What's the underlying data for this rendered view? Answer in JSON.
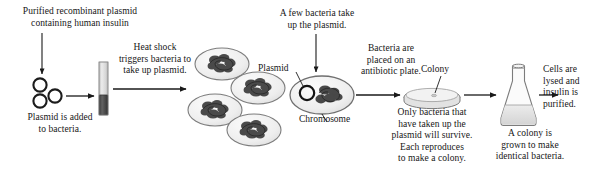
{
  "figure": {
    "background_color": "#ffffff",
    "ink_color": "#161616"
  },
  "captions": {
    "purified_plasmid": "Purified recombinant plasmid\ncontaining human insulin",
    "plasmid_added": "Plasmid is added\nto bacteria.",
    "heat_shock": "Heat shock\ntriggers bacteria to\ntake up plasmid.",
    "few_bacteria": "A few bacteria take\nup the plasmid.",
    "antibiotic_plate": "Bacteria are\nplaced on an\nantibiotic plate.",
    "only_survive": "Only bacteria that\nhave taken up the\nplasmid will survive.\nEach reproduces\nto make a colony.",
    "colony_grown": "A colony is\ngrown to make\nidentical bacteria.",
    "cells_lysed": "Cells are\nlysed and\ninsulin is\npurified."
  },
  "labels": {
    "plasmid": "Plasmid",
    "chromosome": "Chromosome",
    "colony": "Colony"
  },
  "elements": {
    "free_plasmids": {
      "name": "free-plasmid-rings",
      "count": 3,
      "stroke": "#1a1a1a"
    },
    "test_tube": {
      "name": "heat-shock-test-tube",
      "upper_fill": "#d8d8d8",
      "lower_fill": "#4a4a4a"
    },
    "bacteria_cluster": {
      "name": "bacteria-cluster",
      "count": 4,
      "cell_fill": "#efefef",
      "chromosome_fill": "#3a3a3a"
    },
    "transformed_bacterium": {
      "name": "transformed-bacterium",
      "cell_fill": "#efefef",
      "has_plasmid_ring": true,
      "has_chromosome": true
    },
    "petri_dish": {
      "name": "petri-dish",
      "fill": "#ececec",
      "colony_marker": true
    },
    "flask": {
      "name": "erlenmeyer-flask",
      "liquid_fill": "#e6e6e6"
    },
    "arrows": {
      "name": "flow-arrows",
      "count": 7,
      "color": "#1a1a1a"
    }
  }
}
